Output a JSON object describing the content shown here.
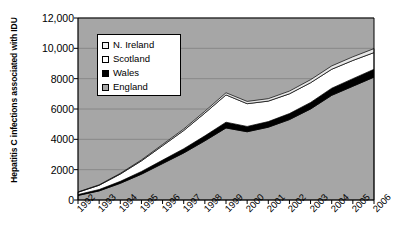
{
  "chart_data": {
    "type": "area",
    "stacked": true,
    "title": "",
    "xlabel": "",
    "ylabel": "Hepatitis C infections associated with IDU",
    "categories": [
      "1992",
      "1993",
      "1994",
      "1995",
      "1996",
      "1997",
      "1998",
      "1999",
      "2000",
      "2001",
      "2002",
      "2003",
      "2004",
      "2005",
      "2006"
    ],
    "ylim": [
      0,
      12000
    ],
    "yticks": [
      "0",
      "2000",
      "4000",
      "6000",
      "8000",
      "10,000",
      "12,000"
    ],
    "ytick_values": [
      0,
      2000,
      4000,
      6000,
      8000,
      10000,
      12000
    ],
    "grid": true,
    "legend_position": "top-left-inside",
    "series": [
      {
        "name": "England",
        "color": "#a6a6a6",
        "values": [
          300,
          600,
          1100,
          1700,
          2400,
          3100,
          3900,
          4750,
          4500,
          4800,
          5300,
          6000,
          6900,
          7500,
          8100
        ]
      },
      {
        "name": "Wales",
        "color": "#000000",
        "values": [
          60,
          90,
          130,
          180,
          230,
          280,
          330,
          380,
          350,
          370,
          400,
          430,
          470,
          500,
          520
        ]
      },
      {
        "name": "Scotland",
        "color": "#ffffff",
        "values": [
          150,
          280,
          480,
          700,
          950,
          1200,
          1500,
          1800,
          1500,
          1350,
          1300,
          1300,
          1250,
          1200,
          1100
        ]
      },
      {
        "name": "N. Ireland",
        "color": "#e8e8e8",
        "values": [
          20,
          30,
          45,
          60,
          80,
          100,
          120,
          140,
          150,
          160,
          180,
          200,
          220,
          240,
          260
        ]
      }
    ],
    "totals": [
      530,
      1000,
      1755,
      2640,
      3660,
      4680,
      5850,
      7070,
      6500,
      6680,
      7180,
      7930,
      8840,
      9440,
      9980
    ]
  },
  "legend": {
    "entries": [
      {
        "label": "N. Ireland",
        "color": "#f2f2f2"
      },
      {
        "label": "Scotland",
        "color": "#ffffff"
      },
      {
        "label": "Wales",
        "color": "#000000"
      },
      {
        "label": "England",
        "color": "#a6a6a6"
      }
    ]
  },
  "style": {
    "plot_background": "#a6a6a6",
    "gridline_color": "#808080",
    "axis_color": "#000000"
  }
}
